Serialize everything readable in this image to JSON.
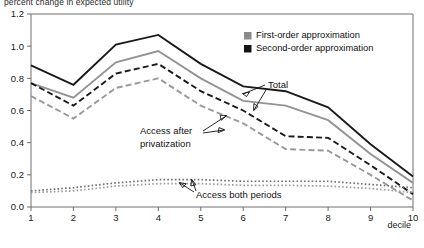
{
  "chart_data": {
    "type": "line",
    "title": "percent change in expected utility",
    "xlabel": "decile",
    "ylabel": "",
    "x": [
      1,
      2,
      3,
      4,
      5,
      6,
      7,
      8,
      9,
      10
    ],
    "xticklabels": [
      "1",
      "2",
      "3",
      "4",
      "5",
      "6",
      "7",
      "8",
      "9",
      "10"
    ],
    "yticklabels": [
      "0.0",
      "0.2",
      "0.4",
      "0.6",
      "0.8",
      "1.0",
      "1.2"
    ],
    "yticks": [
      0.0,
      0.2,
      0.4,
      0.6,
      0.8,
      1.0,
      1.2
    ],
    "xlim": [
      1,
      10
    ],
    "ylim": [
      0.0,
      1.2
    ],
    "grid": false,
    "legend_position": "top-right",
    "series": [
      {
        "name": "Total (second-order approximation)",
        "group": "Total",
        "approximation": "Second-order approximation",
        "color": "#1a1a1a",
        "style": "solid",
        "values": [
          0.88,
          0.76,
          1.01,
          1.07,
          0.89,
          0.75,
          0.72,
          0.62,
          0.39,
          0.19
        ]
      },
      {
        "name": "Total (first-order approximation)",
        "group": "Total",
        "approximation": "First-order approximation",
        "color": "#939393",
        "style": "solid",
        "values": [
          0.77,
          0.68,
          0.9,
          0.97,
          0.8,
          0.66,
          0.63,
          0.54,
          0.33,
          0.15
        ]
      },
      {
        "name": "Access after privatization (second-order approximation)",
        "group": "Access after privatization",
        "approximation": "Second-order approximation",
        "color": "#1a1a1a",
        "style": "dashed",
        "values": [
          0.77,
          0.63,
          0.83,
          0.89,
          0.72,
          0.6,
          0.44,
          0.43,
          0.26,
          0.08
        ]
      },
      {
        "name": "Access after privatization (first-order approximation)",
        "group": "Access after privatization",
        "approximation": "First-order approximation",
        "color": "#9a9a9a",
        "style": "dashed",
        "values": [
          0.69,
          0.55,
          0.74,
          0.8,
          0.63,
          0.52,
          0.36,
          0.35,
          0.2,
          0.04
        ]
      },
      {
        "name": "Access both periods (second-order approximation)",
        "group": "Access both periods",
        "approximation": "Second-order approximation",
        "color": "#6f6f6f",
        "style": "dotted",
        "values": [
          0.1,
          0.12,
          0.15,
          0.17,
          0.17,
          0.16,
          0.16,
          0.16,
          0.14,
          0.12
        ]
      },
      {
        "name": "Access both periods (first-order approximation)",
        "group": "Access both periods",
        "approximation": "First-order approximation",
        "color": "#9d9d9d",
        "style": "dotted",
        "values": [
          0.09,
          0.1,
          0.13,
          0.145,
          0.145,
          0.135,
          0.135,
          0.13,
          0.115,
          0.09
        ]
      }
    ],
    "legend": [
      {
        "label": "First-order approximation",
        "color": "#8c8c8c"
      },
      {
        "label": "Second-order approximation",
        "color": "#141414"
      }
    ],
    "annotations": [
      {
        "id": "total",
        "text": "Total"
      },
      {
        "id": "access-after-privatization",
        "text": "Access after",
        "text2": "privatization"
      },
      {
        "id": "access-both-periods",
        "text": "Access both periods"
      }
    ]
  }
}
